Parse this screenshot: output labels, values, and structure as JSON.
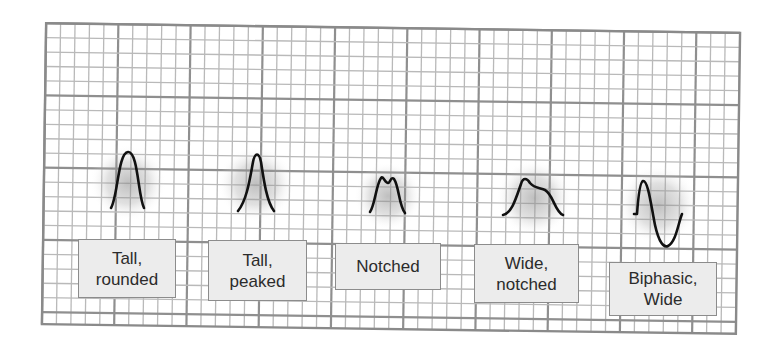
{
  "diagram": {
    "title": "",
    "grid": {
      "x": 44,
      "y": 28,
      "width": 694,
      "height": 301,
      "minor_spacing": 14.45,
      "major_every": 5,
      "minor_color": "#b9b9b9",
      "major_color": "#8f8f8f",
      "border_color": "#8a8a8a",
      "rotation_deg": 0.8
    },
    "waveforms": [
      {
        "name": "tall-rounded",
        "path": "M111 208 C118 196, 118 153, 128 152 C138 151, 138 196, 144 208",
        "glow": {
          "cx": 128,
          "cy": 183,
          "r": 38
        },
        "label": "Tall,\nrounded",
        "label_box": {
          "x": 78,
          "y": 239,
          "w": 98,
          "h": 59
        }
      },
      {
        "name": "tall-peaked",
        "path": "M238 211 C247 200, 250 178, 253 162 C255 152, 259 152, 261 162 C264 182, 267 202, 274 211",
        "glow": {
          "cx": 256,
          "cy": 184,
          "r": 38
        },
        "label": "Tall,\npeaked",
        "label_box": {
          "x": 208,
          "y": 240,
          "w": 99,
          "h": 61
        }
      },
      {
        "name": "notched",
        "path": "M370 212 C375 205, 376 185, 381 178 C383 175, 385 183, 388 183 C390 183, 391 176, 394 179 C399 186, 399 206, 405 213",
        "glow": {
          "cx": 388,
          "cy": 196,
          "r": 34
        },
        "label": "Notched",
        "label_box": {
          "x": 335,
          "y": 243,
          "w": 106,
          "h": 47
        }
      },
      {
        "name": "wide-notched",
        "path": "M503 215 C512 213, 516 198, 521 184 C523 177, 527 178, 530 183 C534 188, 540 188, 545 190 C553 194, 555 212, 563 215",
        "glow": {
          "cx": 534,
          "cy": 198,
          "r": 38
        },
        "label": "Wide,\nnotched",
        "label_box": {
          "x": 474,
          "y": 244,
          "w": 105,
          "h": 59
        }
      },
      {
        "name": "biphasic-wide",
        "path": "M634 214 L637 214 C638 200, 640 182, 643 181 C648 180, 651 205, 655 225 C659 243, 664 248, 668 246 C676 242, 678 224, 682 214",
        "glow": {
          "cx": 658,
          "cy": 205,
          "r": 40
        },
        "label": "Biphasic,\nWide",
        "label_box": {
          "x": 609,
          "y": 262,
          "w": 108,
          "h": 54
        }
      }
    ],
    "colors": {
      "wave_stroke": "#111111",
      "label_fill": "#ececec",
      "label_border": "#8c8c8c",
      "label_text": "#2b2b2b",
      "glow": "#8a8a8a"
    }
  }
}
